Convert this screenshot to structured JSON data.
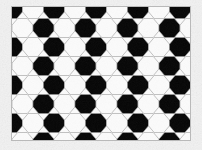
{
  "image": {
    "title": "Soccer ball hexagon tessellation",
    "width": 202,
    "height": 150,
    "background_color": "#f2f2f2",
    "alt_text": "Repeating black-and-white hexagonal soccer-ball pattern inside a thin rectangular border"
  },
  "frame": {
    "name": "pattern-frame",
    "x": 11,
    "y": 6,
    "width": 180,
    "height": 135,
    "border_color": "#b9b9b9",
    "border_width": 1,
    "fill_color": "#ffffff"
  },
  "pattern": {
    "type": "hexagonal-tessellation",
    "description": "Flat-top hexagons arranged in a honeycomb grid; cells alternate between black and white in a soccer-ball motif",
    "orientation": "flat-top",
    "cell_width": 21,
    "cell_height": 19,
    "column_step": 21,
    "row_step": 19,
    "row_offset": 10.5,
    "stroke_color": "#9a9a9a",
    "stroke_width": 0.6,
    "colors": {
      "dark_cell": "#050505",
      "light_cell": "#fbfbfb",
      "edge_line": "#9a9a9a"
    },
    "columns": 10,
    "rows": 9,
    "checker_rule": "dark when (column + row) is even"
  },
  "texture": {
    "name": "paper-noise",
    "outer_opacity": 0.55,
    "inner_opacity": 0.28,
    "speckle_color": "#d8d8d8"
  }
}
